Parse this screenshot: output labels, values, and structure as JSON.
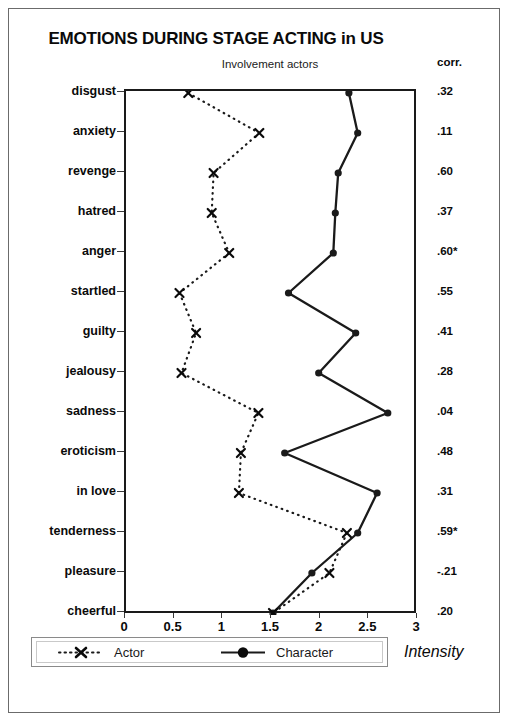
{
  "header": {
    "title": "EMOTIONS DURING STAGE ACTING in US",
    "subtitle": "Involvement actors",
    "corr_header": "corr."
  },
  "axis": {
    "x_title": "Intensity",
    "x_ticks": [
      "0",
      "0.5",
      "1",
      "1.5",
      "2",
      "2.5",
      "3"
    ]
  },
  "legend": {
    "actor_label": "Actor",
    "character_label": "Character"
  },
  "colors": {
    "line": "#1a1a1a",
    "frame": "#6b6b6b",
    "text": "#0a0a0a"
  },
  "rows": [
    {
      "label": "disgust",
      "corr": ".32",
      "actor": 0.64,
      "character": 2.29
    },
    {
      "label": "anxiety",
      "corr": ".11",
      "actor": 1.37,
      "character": 2.38
    },
    {
      "label": "revenge",
      "corr": ".60",
      "actor": 0.9,
      "character": 2.18
    },
    {
      "label": "hatred",
      "corr": ".37",
      "actor": 0.88,
      "character": 2.15
    },
    {
      "label": "anger",
      "corr": ".60*",
      "actor": 1.06,
      "character": 2.13
    },
    {
      "label": "startled",
      "corr": ".55",
      "actor": 0.55,
      "character": 1.67
    },
    {
      "label": "guilty",
      "corr": ".41",
      "actor": 0.72,
      "character": 2.36
    },
    {
      "label": "jealousy",
      "corr": ".28",
      "actor": 0.57,
      "character": 1.98
    },
    {
      "label": "sadness",
      "corr": ".04",
      "actor": 1.36,
      "character": 2.69
    },
    {
      "label": "eroticism",
      "corr": ".48",
      "actor": 1.18,
      "character": 1.63
    },
    {
      "label": "in love",
      "corr": ".31",
      "actor": 1.16,
      "character": 2.58
    },
    {
      "label": "tenderness",
      "corr": ".59*",
      "actor": 2.27,
      "character": 2.38
    },
    {
      "label": "pleasure",
      "corr": "-.21",
      "actor": 2.09,
      "character": 1.91
    },
    {
      "label": "cheerful",
      "corr": ".20",
      "actor": 1.51,
      "character": 1.51
    }
  ],
  "chart_data": {
    "type": "line",
    "title": "EMOTIONS DURING STAGE ACTING in US",
    "subtitle": "Involvement actors",
    "xlabel": "Intensity",
    "ylabel": "",
    "xlim": [
      0,
      3
    ],
    "x_ticks": [
      0,
      0.5,
      1,
      1.5,
      2,
      2.5,
      3
    ],
    "grid": false,
    "orientation": "horizontal",
    "legend_position": "bottom-left",
    "categories": [
      "disgust",
      "anxiety",
      "revenge",
      "hatred",
      "anger",
      "startled",
      "guilty",
      "jealousy",
      "sadness",
      "eroticism",
      "in love",
      "tenderness",
      "pleasure",
      "cheerful"
    ],
    "series": [
      {
        "name": "Actor",
        "marker": "x",
        "linestyle": "dotted",
        "values": [
          0.64,
          1.37,
          0.9,
          0.88,
          1.06,
          0.55,
          0.72,
          0.57,
          1.36,
          1.18,
          1.16,
          2.27,
          2.09,
          1.51
        ]
      },
      {
        "name": "Character",
        "marker": "circle",
        "linestyle": "solid",
        "values": [
          2.29,
          2.38,
          2.18,
          2.15,
          2.13,
          1.67,
          2.36,
          1.98,
          2.69,
          1.63,
          2.58,
          2.38,
          1.91,
          1.51
        ]
      }
    ],
    "annotations": {
      "column_header": "corr.",
      "correlations": [
        ".32",
        ".11",
        ".60",
        ".37",
        ".60*",
        ".55",
        ".41",
        ".28",
        ".04",
        ".48",
        ".31",
        ".59*",
        "-.21",
        ".20"
      ],
      "note": "* marks significance"
    }
  }
}
